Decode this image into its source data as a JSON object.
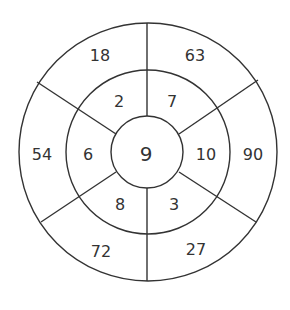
{
  "diagram": {
    "type": "concentric-number-wheel",
    "center": {
      "value": "9"
    },
    "inner_ring": [
      {
        "position": "top-left",
        "value": "2"
      },
      {
        "position": "top-right",
        "value": "7"
      },
      {
        "position": "right",
        "value": "10"
      },
      {
        "position": "bottom-right",
        "value": "3"
      },
      {
        "position": "bottom-left",
        "value": "8"
      },
      {
        "position": "left",
        "value": "6"
      }
    ],
    "outer_ring": [
      {
        "position": "top-left",
        "value": "18"
      },
      {
        "position": "top-right",
        "value": "63"
      },
      {
        "position": "right",
        "value": "90"
      },
      {
        "position": "bottom-right",
        "value": "27"
      },
      {
        "position": "bottom-left",
        "value": "72"
      },
      {
        "position": "left",
        "value": "54"
      }
    ],
    "line_color": "#333333",
    "text_color": "#333333",
    "background": "#ffffff"
  }
}
